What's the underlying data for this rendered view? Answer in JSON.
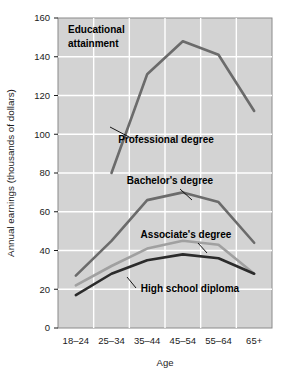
{
  "chart_data": {
    "type": "line",
    "title": "",
    "note": {
      "line1": "Educational",
      "line2": "attainment"
    },
    "xlabel": "Age",
    "ylabel": "Annual earnings (thousands of dollars)",
    "categories": [
      "18–24",
      "25–34",
      "35–44",
      "45–54",
      "55–64",
      "65+"
    ],
    "ytick_labels": [
      "0",
      "20",
      "40",
      "60",
      "80",
      "100",
      "120",
      "140",
      "160"
    ],
    "ytick_values": [
      0,
      20,
      40,
      60,
      80,
      100,
      120,
      140,
      160
    ],
    "ylim": [
      0,
      160
    ],
    "grid": true,
    "legend_position": "inline-annotations",
    "plot_bg_color": "#d3d3d3",
    "grid_color": "#ffffff",
    "series": [
      {
        "name": "Professional degree",
        "color": "#6b6b6b",
        "values": [
          null,
          80,
          131,
          148,
          141,
          112
        ],
        "label_x": 166,
        "label_y": 143,
        "leader": {
          "x1": 131,
          "y1": 138,
          "x2": 110,
          "y2": 127
        }
      },
      {
        "name": "Bachelor's degree",
        "color": "#6b6b6b",
        "values": [
          27,
          45,
          66,
          70,
          65,
          44
        ],
        "label_x": 170,
        "label_y": 184,
        "leader": {
          "x1": 180,
          "y1": 189,
          "x2": 192,
          "y2": 200
        }
      },
      {
        "name": "Associate's degree",
        "color": "#a0a0a0",
        "values": [
          22,
          32,
          41,
          45,
          43,
          28
        ],
        "label_x": 186,
        "label_y": 238,
        "leader": {
          "x1": 198,
          "y1": 243,
          "x2": 207,
          "y2": 253
        }
      },
      {
        "name": "High school diploma",
        "color": "#2b2b2b",
        "values": [
          17,
          28,
          35,
          38,
          36,
          28
        ],
        "label_x": 190,
        "label_y": 292,
        "leader": {
          "x1": 136,
          "y1": 288,
          "x2": 127,
          "y2": 277
        }
      }
    ]
  }
}
